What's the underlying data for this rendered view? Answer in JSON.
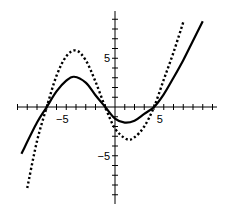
{
  "chart_data": {
    "type": "line",
    "title": "",
    "xlabel": "",
    "ylabel": "",
    "xlim": [
      -10,
      10
    ],
    "ylim": [
      -10,
      10
    ],
    "grid": false,
    "tick_labels": {
      "x": [
        {
          "value": -5,
          "label": "−5"
        },
        {
          "value": 5,
          "label": "5"
        }
      ],
      "y": [
        {
          "value": 5,
          "label": "5"
        },
        {
          "value": -5,
          "label": "−5"
        }
      ]
    },
    "series": [
      {
        "name": "solid curve",
        "style": "solid",
        "color": "#000000",
        "x": [
          -9.6,
          -8,
          -7,
          -6,
          -5,
          -4.2,
          -3,
          -2,
          -1,
          0,
          1,
          2,
          3,
          4,
          5,
          6,
          7,
          8,
          9
        ],
        "y": [
          -4.8,
          -1.6,
          0,
          1.6,
          2.7,
          3.1,
          2.5,
          1.2,
          0,
          -1.2,
          -1.6,
          -1.4,
          -0.7,
          0,
          1.3,
          3,
          4.8,
          6.8,
          8.8
        ]
      },
      {
        "name": "dotted curve",
        "style": "dotted",
        "color": "#000000",
        "x": [
          -9,
          -8,
          -7,
          -6,
          -5,
          -4,
          -3,
          -2,
          -1,
          0,
          1.2,
          2,
          3,
          4,
          5,
          6,
          7
        ],
        "y": [
          -8.3,
          -3.5,
          0,
          3.2,
          5.2,
          5.8,
          4.8,
          2.6,
          0,
          -2.2,
          -3.3,
          -3.1,
          -2,
          0,
          2.8,
          5.6,
          8.7
        ]
      }
    ]
  }
}
